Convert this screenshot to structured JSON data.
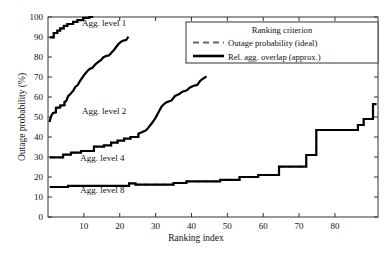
{
  "chart_data": {
    "type": "line",
    "title": "",
    "xlabel": "Ranking index",
    "ylabel": "Outage probability (%)",
    "xlim": [
      0,
      92
    ],
    "ylim": [
      0,
      100
    ],
    "xticks": [
      10,
      20,
      30,
      40,
      50,
      60,
      70,
      80
    ],
    "yticks": [
      0,
      10,
      20,
      30,
      40,
      50,
      60,
      70,
      80,
      90,
      100
    ],
    "grid": false,
    "legend": {
      "title": "Ranking criterion",
      "position": "upper-right",
      "entries": [
        {
          "label": "Outage probability (ideal)",
          "style": "dashed",
          "color": "#555555"
        },
        {
          "label": "Rel. agg. overlap (approx.)",
          "style": "solid",
          "color": "#000000"
        }
      ]
    },
    "annotations": [
      {
        "text": "Agg. level 1",
        "x": 9.5,
        "y": 95.5
      },
      {
        "text": "Agg. level 2",
        "x": 9.5,
        "y": 51.5
      },
      {
        "text": "Agg. level 4",
        "x": 9.0,
        "y": 28.0
      },
      {
        "text": "Agg. level 8",
        "x": 9.0,
        "y": 12.0
      }
    ],
    "series": [
      {
        "name": "Agg. level 1 - Rel. agg. overlap (approx.)",
        "style": "solid",
        "color": "#000000",
        "points": [
          [
            0.5,
            89.8
          ],
          [
            1.6,
            89.8
          ],
          [
            1.6,
            92.0
          ],
          [
            2.6,
            92.0
          ],
          [
            2.6,
            93.2
          ],
          [
            3.4,
            93.2
          ],
          [
            3.4,
            94.3
          ],
          [
            4.4,
            94.3
          ],
          [
            4.4,
            95.6
          ],
          [
            5.4,
            95.6
          ],
          [
            5.4,
            96.5
          ],
          [
            7.0,
            96.5
          ],
          [
            7.0,
            97.6
          ],
          [
            8.2,
            97.6
          ],
          [
            8.2,
            98.4
          ],
          [
            9.8,
            98.4
          ],
          [
            9.8,
            99.6
          ],
          [
            11.5,
            99.6
          ],
          [
            11.5,
            100.0
          ],
          [
            12.6,
            100.0
          ]
        ]
      },
      {
        "name": "Agg. level 1 - Outage probability (ideal)",
        "style": "dashed",
        "color": "#666666",
        "points": [
          [
            0.5,
            89.8
          ],
          [
            1.6,
            89.8
          ],
          [
            1.6,
            92.0
          ],
          [
            2.6,
            92.0
          ],
          [
            2.6,
            93.2
          ],
          [
            3.4,
            93.2
          ],
          [
            3.4,
            94.3
          ],
          [
            4.4,
            94.3
          ],
          [
            4.4,
            95.6
          ],
          [
            5.4,
            95.6
          ],
          [
            5.4,
            96.5
          ],
          [
            7.0,
            96.5
          ],
          [
            7.0,
            97.6
          ],
          [
            8.2,
            97.6
          ],
          [
            8.2,
            98.4
          ],
          [
            9.8,
            98.4
          ],
          [
            9.8,
            99.6
          ],
          [
            11.5,
            99.6
          ],
          [
            11.5,
            100.0
          ],
          [
            12.6,
            100.0
          ]
        ]
      },
      {
        "name": "Agg. level 2 - Rel. agg. overlap (approx.)",
        "style": "solid",
        "color": "#000000",
        "points": [
          [
            0.4,
            47.5
          ],
          [
            0.9,
            50.5
          ],
          [
            1.4,
            52.0
          ],
          [
            2.2,
            52.3
          ],
          [
            2.2,
            54.6
          ],
          [
            3.4,
            54.8
          ],
          [
            3.4,
            55.7
          ],
          [
            4.6,
            55.9
          ],
          [
            4.6,
            57.5
          ],
          [
            5.1,
            58.0
          ],
          [
            5.6,
            60.4
          ],
          [
            6.1,
            61.2
          ],
          [
            6.7,
            62.5
          ],
          [
            7.0,
            63.0
          ],
          [
            7.6,
            65.0
          ],
          [
            8.3,
            66.0
          ],
          [
            8.9,
            68.0
          ],
          [
            9.5,
            69.5
          ],
          [
            10.2,
            71.3
          ],
          [
            11.0,
            73.0
          ],
          [
            11.6,
            74.0
          ],
          [
            12.4,
            74.6
          ],
          [
            13.2,
            76.3
          ],
          [
            14.0,
            77.5
          ],
          [
            14.8,
            78.5
          ],
          [
            15.4,
            79.8
          ],
          [
            16.2,
            80.5
          ],
          [
            17.0,
            80.8
          ],
          [
            17.6,
            82.0
          ],
          [
            18.4,
            83.5
          ],
          [
            19.0,
            85.0
          ],
          [
            19.7,
            86.6
          ],
          [
            20.4,
            87.7
          ],
          [
            21.0,
            88.2
          ],
          [
            21.8,
            88.5
          ],
          [
            22.4,
            90.2
          ]
        ]
      },
      {
        "name": "Agg. level 2 - Outage probability (ideal)",
        "style": "dashed",
        "color": "#666666",
        "points": [
          [
            0.4,
            47.5
          ],
          [
            0.9,
            50.5
          ],
          [
            1.4,
            52.0
          ],
          [
            2.2,
            52.3
          ],
          [
            2.2,
            54.6
          ],
          [
            3.4,
            54.8
          ],
          [
            3.4,
            55.7
          ],
          [
            4.6,
            55.9
          ],
          [
            4.6,
            57.5
          ],
          [
            5.1,
            58.0
          ],
          [
            5.6,
            60.4
          ],
          [
            6.1,
            61.2
          ],
          [
            6.7,
            62.5
          ],
          [
            7.0,
            63.0
          ],
          [
            7.6,
            65.0
          ],
          [
            8.3,
            66.0
          ],
          [
            8.9,
            68.0
          ],
          [
            9.5,
            69.5
          ],
          [
            10.2,
            71.3
          ],
          [
            11.0,
            73.0
          ],
          [
            11.6,
            74.0
          ],
          [
            12.4,
            74.6
          ],
          [
            13.2,
            76.3
          ],
          [
            14.0,
            77.5
          ],
          [
            14.8,
            78.5
          ],
          [
            15.4,
            79.8
          ],
          [
            16.2,
            80.5
          ],
          [
            17.0,
            80.8
          ],
          [
            17.6,
            82.0
          ],
          [
            18.4,
            83.5
          ],
          [
            19.0,
            85.0
          ],
          [
            19.7,
            86.6
          ],
          [
            20.4,
            87.7
          ],
          [
            21.0,
            88.2
          ],
          [
            21.8,
            88.5
          ],
          [
            22.4,
            90.2
          ]
        ]
      },
      {
        "name": "Agg. level 4 - Rel. agg. overlap (approx.)",
        "style": "solid",
        "color": "#000000",
        "points": [
          [
            0.5,
            29.8
          ],
          [
            4.2,
            29.8
          ],
          [
            4.2,
            31.2
          ],
          [
            6.4,
            31.2
          ],
          [
            6.4,
            32.2
          ],
          [
            9.2,
            32.2
          ],
          [
            9.2,
            33.0
          ],
          [
            12.8,
            33.0
          ],
          [
            12.8,
            35.2
          ],
          [
            15.6,
            35.2
          ],
          [
            15.6,
            35.8
          ],
          [
            17.6,
            35.8
          ],
          [
            17.6,
            37.2
          ],
          [
            19.4,
            37.2
          ],
          [
            19.4,
            38.2
          ],
          [
            21.2,
            38.2
          ],
          [
            21.2,
            39.2
          ],
          [
            23.0,
            39.2
          ],
          [
            23.0,
            40.0
          ],
          [
            25.2,
            40.0
          ],
          [
            25.2,
            41.6
          ],
          [
            26.6,
            42.8
          ],
          [
            27.4,
            43.4
          ],
          [
            28.2,
            45.2
          ],
          [
            29.0,
            47.0
          ],
          [
            29.8,
            49.0
          ],
          [
            30.4,
            51.0
          ],
          [
            31.0,
            53.0
          ],
          [
            31.6,
            55.0
          ],
          [
            32.4,
            56.6
          ],
          [
            33.2,
            57.5
          ],
          [
            34.4,
            58.2
          ],
          [
            35.4,
            60.5
          ],
          [
            36.6,
            61.5
          ],
          [
            37.6,
            62.8
          ],
          [
            38.6,
            63.2
          ],
          [
            39.6,
            64.8
          ],
          [
            40.6,
            65.6
          ],
          [
            41.6,
            66.0
          ],
          [
            42.4,
            68.0
          ],
          [
            43.4,
            69.4
          ],
          [
            44.2,
            70.3
          ]
        ]
      },
      {
        "name": "Agg. level 4 - Outage probability (ideal)",
        "style": "dashed",
        "color": "#666666",
        "points": [
          [
            0.5,
            29.8
          ],
          [
            4.2,
            29.8
          ],
          [
            4.2,
            31.2
          ],
          [
            6.4,
            31.2
          ],
          [
            6.4,
            32.2
          ],
          [
            9.2,
            32.2
          ],
          [
            9.2,
            33.0
          ],
          [
            12.8,
            33.0
          ],
          [
            12.8,
            35.2
          ],
          [
            15.6,
            35.2
          ],
          [
            15.6,
            35.8
          ],
          [
            17.6,
            35.8
          ],
          [
            17.6,
            37.2
          ],
          [
            19.4,
            37.2
          ],
          [
            19.4,
            38.2
          ],
          [
            21.2,
            38.2
          ],
          [
            21.2,
            39.2
          ],
          [
            23.0,
            39.2
          ],
          [
            23.0,
            40.0
          ],
          [
            25.2,
            40.0
          ],
          [
            25.2,
            41.6
          ],
          [
            26.6,
            42.8
          ],
          [
            27.4,
            43.4
          ],
          [
            28.2,
            45.2
          ],
          [
            29.0,
            47.0
          ],
          [
            29.8,
            49.0
          ],
          [
            30.4,
            51.0
          ],
          [
            31.0,
            53.0
          ],
          [
            31.6,
            55.0
          ],
          [
            32.4,
            56.6
          ],
          [
            33.2,
            57.5
          ],
          [
            34.4,
            58.2
          ],
          [
            35.4,
            60.5
          ],
          [
            36.6,
            61.5
          ],
          [
            37.6,
            62.8
          ],
          [
            38.6,
            63.2
          ],
          [
            39.6,
            64.8
          ],
          [
            40.6,
            65.6
          ],
          [
            41.6,
            66.0
          ],
          [
            42.4,
            68.0
          ],
          [
            43.4,
            69.4
          ],
          [
            44.2,
            70.3
          ]
        ]
      },
      {
        "name": "Agg. level 8 - Rel. agg. overlap (approx.)",
        "style": "solid",
        "color": "#000000",
        "points": [
          [
            0.5,
            15.0
          ],
          [
            5.6,
            15.0
          ],
          [
            5.6,
            15.6
          ],
          [
            22.6,
            15.6
          ],
          [
            22.6,
            16.8
          ],
          [
            24.4,
            16.8
          ],
          [
            24.4,
            16.2
          ],
          [
            35.0,
            16.2
          ],
          [
            35.0,
            17.0
          ],
          [
            38.6,
            17.0
          ],
          [
            38.6,
            17.8
          ],
          [
            48.0,
            17.8
          ],
          [
            48.0,
            18.6
          ],
          [
            53.4,
            18.6
          ],
          [
            53.4,
            20.0
          ],
          [
            58.6,
            20.0
          ],
          [
            58.6,
            21.0
          ],
          [
            64.4,
            21.0
          ],
          [
            64.4,
            25.2
          ],
          [
            72.0,
            25.2
          ],
          [
            72.0,
            31.0
          ],
          [
            74.8,
            31.0
          ],
          [
            74.8,
            43.5
          ],
          [
            86.4,
            43.5
          ],
          [
            86.4,
            46.0
          ],
          [
            88.0,
            46.0
          ],
          [
            88.0,
            49.0
          ],
          [
            90.6,
            49.0
          ],
          [
            90.6,
            56.4
          ],
          [
            91.6,
            56.4
          ]
        ]
      },
      {
        "name": "Agg. level 8 - Outage probability (ideal)",
        "style": "dashed",
        "color": "#666666",
        "points": [
          [
            0.5,
            15.0
          ],
          [
            5.6,
            15.0
          ],
          [
            5.6,
            15.6
          ],
          [
            22.6,
            15.6
          ],
          [
            22.6,
            16.8
          ],
          [
            24.4,
            16.8
          ],
          [
            24.4,
            16.2
          ],
          [
            35.0,
            16.2
          ],
          [
            35.0,
            17.0
          ],
          [
            38.6,
            17.0
          ],
          [
            38.6,
            17.8
          ],
          [
            48.0,
            17.8
          ],
          [
            48.0,
            18.6
          ],
          [
            53.4,
            18.6
          ],
          [
            53.4,
            20.0
          ],
          [
            58.6,
            20.0
          ],
          [
            58.6,
            21.0
          ],
          [
            64.4,
            21.0
          ],
          [
            64.4,
            25.2
          ],
          [
            72.0,
            25.2
          ],
          [
            72.0,
            31.0
          ],
          [
            74.8,
            31.0
          ],
          [
            74.8,
            43.5
          ],
          [
            86.4,
            43.5
          ],
          [
            86.4,
            46.0
          ],
          [
            88.0,
            46.0
          ],
          [
            88.0,
            49.0
          ],
          [
            90.6,
            49.0
          ],
          [
            90.6,
            56.4
          ],
          [
            91.6,
            56.4
          ]
        ]
      }
    ]
  },
  "axes": {
    "xlabel": "Ranking index",
    "ylabel": "Outage probability (%)",
    "xticks": [
      "10",
      "20",
      "30",
      "40",
      "50",
      "60",
      "70",
      "80"
    ],
    "yticks": [
      "0",
      "10",
      "20",
      "30",
      "40",
      "50",
      "60",
      "70",
      "80",
      "90",
      "100"
    ]
  },
  "legend": {
    "title": "Ranking criterion",
    "item_ideal": "Outage probability (ideal)",
    "item_approx": "Rel. agg. overlap (approx.)"
  },
  "annotations": {
    "level1": "Agg. level 1",
    "level2": "Agg. level 2",
    "level4": "Agg. level 4",
    "level8": "Agg. level 8"
  },
  "colors": {
    "solid": "#000000",
    "dashed": "#666666",
    "axis": "#444444",
    "background": "#ffffff"
  }
}
